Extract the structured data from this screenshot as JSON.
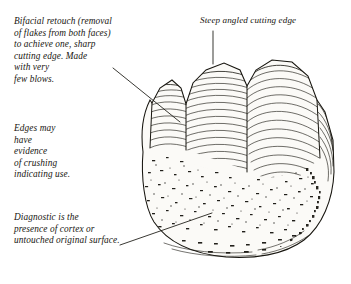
{
  "figure": {
    "style": "archaeological pen-and-ink line drawing",
    "background_color": "#ffffff",
    "ink_color": "#17150f"
  },
  "annotations": [
    {
      "id": "bifacial-retouch",
      "text": "Bifacial retouch (removal\nof flakes from both faces)\nto achieve one, sharp\ncutting edge. Made\nwith very\nfew blows.",
      "leader": "diagonal-down-right"
    },
    {
      "id": "steep-angled-cutting-edge",
      "text": "Steep angled cutting edge",
      "leader": "vertical-down"
    },
    {
      "id": "edges-crushing",
      "text": "Edges may\nhave\nevidence\nof crushing\nindicating use.",
      "leader": "none"
    },
    {
      "id": "diagnostic-cortex",
      "text": "Diagnostic is the\npresence of cortex or\nuntouched original surface.",
      "leader": "diagonal-up-right"
    }
  ]
}
